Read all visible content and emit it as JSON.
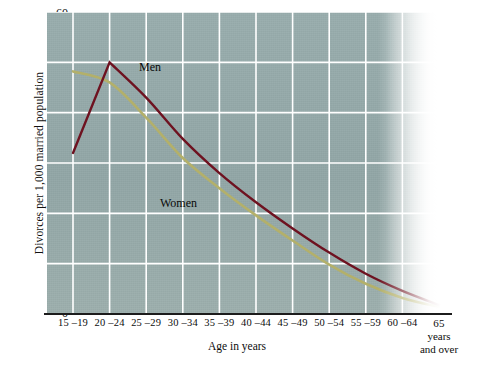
{
  "chart_data": {
    "type": "line",
    "title": "",
    "xlabel": "Age in years",
    "ylabel": "Divorces per 1,000 married population",
    "categories": [
      "15 –19",
      "20 –24",
      "25 –29",
      "30 –34",
      "35 –39",
      "40 –44",
      "45 –49",
      "50 –54",
      "55 –59",
      "60 –64",
      "65"
    ],
    "last_category_extra_line1": "years",
    "last_category_extra_line2": "and over",
    "ylim": [
      0,
      60
    ],
    "yticks": [
      0,
      10,
      20,
      30,
      40,
      50,
      60
    ],
    "grid": true,
    "legend": "inline-annotations",
    "series": [
      {
        "name": "Men",
        "color": "#6e1220",
        "values": [
          32.0,
          50.0,
          43.0,
          34.8,
          28.0,
          22.2,
          17.0,
          12.2,
          8.0,
          4.6,
          1.8
        ]
      },
      {
        "name": "Women",
        "color": "#b3b06a",
        "values": [
          48.2,
          46.0,
          39.0,
          31.0,
          25.0,
          19.6,
          14.6,
          9.8,
          6.0,
          3.2,
          1.4
        ]
      }
    ],
    "annotations": [
      {
        "text": "Men",
        "series": "Men"
      },
      {
        "text": "Women",
        "series": "Women"
      }
    ]
  },
  "axis": {
    "y_title": "Divorces per 1,000 married population",
    "x_title": "Age in years",
    "y_tick_labels": [
      "60",
      "50",
      "40",
      "30",
      "20",
      "10",
      "0"
    ],
    "x_tick_labels": [
      "15 –19",
      "20 –24",
      "25 –29",
      "30 –34",
      "35 –39",
      "40 –44",
      "45 –49",
      "50 –54",
      "55 –59",
      "60 –64",
      "65"
    ],
    "x_last_extra": {
      "line1": "years",
      "line2": "and over"
    }
  },
  "labels": {
    "men": "Men",
    "women": "Women"
  },
  "colors": {
    "men_line": "#6e1220",
    "women_line": "#b3b06a",
    "plot_background": "#96aaaa",
    "gridline": "#ffffff",
    "axis_line": "#1c1c1c",
    "text": "#0d0d0d"
  }
}
